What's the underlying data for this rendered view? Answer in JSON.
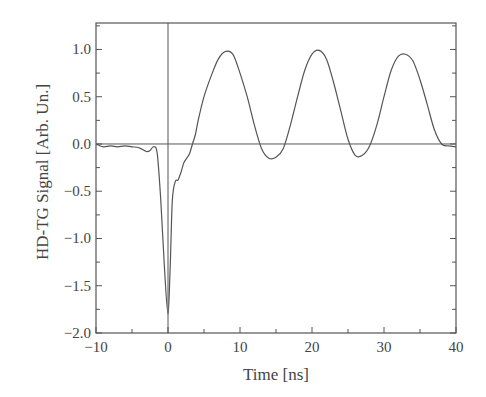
{
  "chart_data": {
    "type": "line",
    "title": "",
    "xlabel": "Time [ns]",
    "ylabel": "HD-TG Signal [Arb. Un.]",
    "xlim": [
      -10,
      40
    ],
    "ylim": [
      -2.0,
      1.28
    ],
    "xticks": [
      -10,
      0,
      10,
      20,
      30,
      40
    ],
    "xtick_labels": [
      "−10",
      "0",
      "10",
      "20",
      "30",
      "40"
    ],
    "yticks": [
      1.0,
      0.5,
      0.0,
      -0.5,
      -1.0,
      -1.5,
      -2.0
    ],
    "ytick_labels": [
      "1.0",
      "0.5",
      "0.0",
      "−0.5",
      "−1.0",
      "−1.5",
      "−2.0"
    ],
    "grid": false,
    "legend": null,
    "reference_lines": {
      "horizontal_y": 0.0,
      "vertical_x": 0.0
    },
    "series": [
      {
        "name": "HD-TG signal",
        "x": [
          -10,
          -9,
          -8,
          -7,
          -6,
          -5,
          -4,
          -3,
          -2.5,
          -2,
          -1.5,
          -1,
          -0.5,
          0,
          0.3,
          0.6,
          1,
          1.4,
          1.8,
          2.2,
          2.6,
          3,
          3.4,
          3.8,
          4.2,
          5,
          6,
          7,
          8,
          9,
          10,
          11,
          12,
          13,
          14,
          15,
          16,
          17,
          18,
          19,
          20,
          21,
          22,
          23,
          24,
          25,
          26,
          27,
          28,
          29,
          30,
          31,
          32,
          33,
          34,
          35,
          36,
          37,
          38,
          39,
          40
        ],
        "y": [
          0.0,
          -0.03,
          -0.02,
          -0.03,
          -0.02,
          -0.03,
          -0.04,
          -0.08,
          -0.07,
          -0.03,
          -0.1,
          -0.6,
          -1.3,
          -1.8,
          -1.3,
          -0.6,
          -0.4,
          -0.38,
          -0.3,
          -0.2,
          -0.15,
          -0.1,
          0.0,
          0.1,
          0.25,
          0.5,
          0.72,
          0.9,
          0.98,
          0.95,
          0.75,
          0.5,
          0.2,
          -0.05,
          -0.15,
          -0.14,
          -0.05,
          0.2,
          0.5,
          0.78,
          0.95,
          0.99,
          0.9,
          0.65,
          0.35,
          0.05,
          -0.12,
          -0.12,
          -0.02,
          0.2,
          0.5,
          0.78,
          0.93,
          0.95,
          0.88,
          0.68,
          0.42,
          0.15,
          0.0,
          -0.02,
          -0.03
        ]
      }
    ]
  }
}
